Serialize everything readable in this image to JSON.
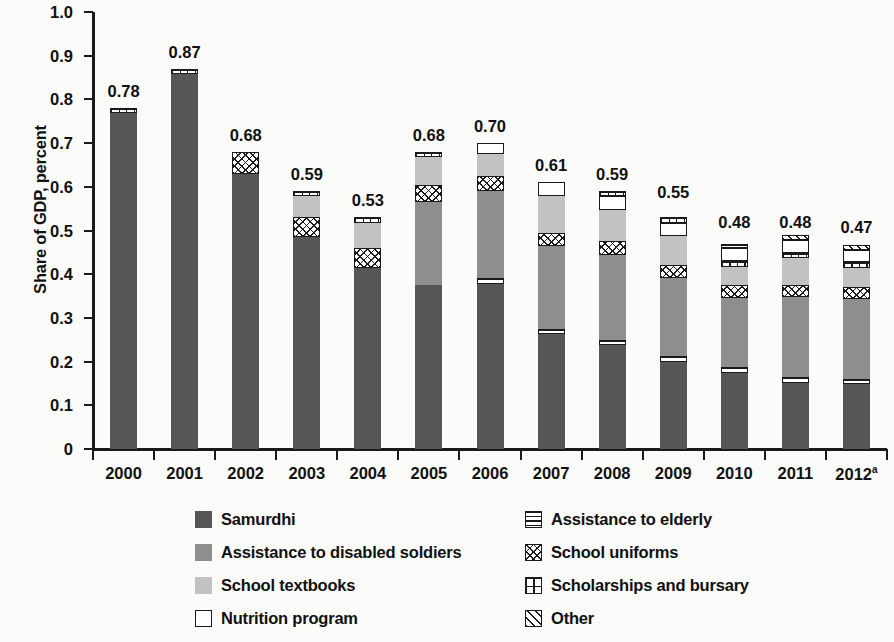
{
  "chart": {
    "type": "bar",
    "title": "",
    "ylabel": "Share of GDP, percent",
    "xlabel": ""
  },
  "axis": {
    "y_ticks": [
      "1.0",
      "0.9",
      "0.8",
      "0.7",
      "0.6",
      "0.5",
      "0.4",
      "0.3",
      "0.2",
      "0.1",
      "0"
    ],
    "y_values": [
      1.0,
      0.9,
      0.8,
      0.7,
      0.6,
      0.5,
      0.4,
      0.3,
      0.2,
      0.1,
      0
    ],
    "x_labels": [
      "2000",
      "2001",
      "2002",
      "2003",
      "2004",
      "2005",
      "2006",
      "2007",
      "2008",
      "2009",
      "2010",
      "2011"
    ],
    "x_label_last": "2012",
    "x_label_last_sup": "a"
  },
  "legend": {
    "items": [
      {
        "label": "Samurdhi",
        "key": "samurdhi",
        "pattern": "solid-dark-gray",
        "color": "#565656"
      },
      {
        "label": "Assistance to elderly",
        "key": "elderly",
        "pattern": "horizontal-lines",
        "color": "#ffffff"
      },
      {
        "label": "Assistance to disabled soldiers",
        "key": "soldiers",
        "pattern": "solid-medium-gray",
        "color": "#8e8e8e"
      },
      {
        "label": "School uniforms",
        "key": "uniforms",
        "pattern": "crosshatch",
        "color": "#ffffff"
      },
      {
        "label": "School textbooks",
        "key": "textbooks",
        "pattern": "solid-light-gray",
        "color": "#c2c2c2"
      },
      {
        "label": "Scholarships and bursary",
        "key": "scholar",
        "pattern": "grid",
        "color": "#ffffff"
      },
      {
        "label": "Nutrition program",
        "key": "nutrition",
        "pattern": "open-white",
        "color": "#ffffff"
      },
      {
        "label": "Other",
        "key": "other",
        "pattern": "diagonal-hatch",
        "color": "#ffffff"
      }
    ]
  },
  "chart_data": {
    "type": "bar",
    "subtype": "stacked",
    "title": "",
    "xlabel": "",
    "ylabel": "Share of GDP, percent",
    "ylim": [
      0,
      1.0
    ],
    "ytick_step": 0.1,
    "grid": false,
    "legend_position": "bottom",
    "categories": [
      "2000",
      "2001",
      "2002",
      "2003",
      "2004",
      "2005",
      "2006",
      "2007",
      "2008",
      "2009",
      "2010",
      "2011",
      "2012"
    ],
    "category_notes": {
      "2012": "a"
    },
    "stack_order_bottom_to_top": [
      "samurdhi",
      "elderly",
      "soldiers",
      "textbooks",
      "uniforms",
      "textbooks2",
      "scholar",
      "nutrition",
      "other"
    ],
    "series": [
      {
        "name": "Samurdhi",
        "key": "samurdhi",
        "values": [
          0.77,
          0.86,
          0.63,
          0.485,
          0.415,
          0.375,
          0.38,
          0.263,
          0.238,
          0.2,
          0.173,
          0.15,
          0.148
        ]
      },
      {
        "name": "Assistance to elderly",
        "key": "elderly",
        "values": [
          0.0,
          0.0,
          0.0,
          0.0,
          0.0,
          0.0,
          0.013,
          0.012,
          0.012,
          0.013,
          0.014,
          0.015,
          0.013
        ]
      },
      {
        "name": "Assistance to disabled soldiers",
        "key": "soldiers",
        "values": [
          0.0,
          0.0,
          0.0,
          0.0,
          0.0,
          0.175,
          0.195,
          0.175,
          0.175,
          0.175,
          0.155,
          0.18,
          0.18
        ]
      },
      {
        "name": "School uniforms",
        "key": "uniforms",
        "values": [
          0.0,
          0.0,
          0.05,
          0.045,
          0.045,
          0.04,
          0.035,
          0.03,
          0.03,
          0.03,
          0.03,
          0.028,
          0.027
        ]
      },
      {
        "name": "School textbooks",
        "key": "textbooks",
        "values": [
          0.0,
          0.0,
          0.0,
          0.05,
          0.045,
          0.055,
          0.045,
          0.085,
          0.09,
          0.09,
          0.042,
          0.06,
          0.045
        ]
      },
      {
        "name": "Scholarships and bursary",
        "key": "scholar",
        "values": [
          0.01,
          0.012,
          0.0,
          0.01,
          0.012,
          0.012,
          0.0,
          0.0,
          0.012,
          0.013,
          0.013,
          0.012,
          0.013
        ]
      },
      {
        "name": "Nutrition program",
        "key": "nutrition",
        "values": [
          0.0,
          0.0,
          0.0,
          0.0,
          0.0,
          0.0,
          0.025,
          0.03,
          0.03,
          0.03,
          0.03,
          0.03,
          0.027
        ]
      },
      {
        "name": "Other",
        "key": "other",
        "values": [
          0.0,
          0.0,
          0.0,
          0.0,
          0.0,
          0.0,
          0.0,
          0.0,
          0.0,
          0.0,
          0.0,
          0.012,
          0.013
        ]
      }
    ],
    "totals": [
      0.78,
      0.87,
      0.68,
      0.59,
      0.53,
      0.68,
      0.7,
      0.61,
      0.59,
      0.55,
      0.48,
      0.48,
      0.47
    ],
    "total_labels": [
      "0.78",
      "0.87",
      "0.68",
      "0.59",
      "0.53",
      "0.68",
      "0.70",
      "0.61",
      "0.59",
      "0.55",
      "0.48",
      "0.48",
      "0.47"
    ],
    "bars": [
      {
        "category": "2000",
        "total": 0.78,
        "label": "0.78",
        "segments": [
          {
            "key": "samurdhi",
            "value": 0.77
          },
          {
            "key": "scholar",
            "value": 0.01
          }
        ]
      },
      {
        "category": "2001",
        "total": 0.87,
        "label": "0.87",
        "segments": [
          {
            "key": "samurdhi",
            "value": 0.858
          },
          {
            "key": "scholar",
            "value": 0.012
          }
        ]
      },
      {
        "category": "2002",
        "total": 0.68,
        "label": "0.68",
        "segments": [
          {
            "key": "samurdhi",
            "value": 0.63
          },
          {
            "key": "uniforms",
            "value": 0.05
          }
        ]
      },
      {
        "category": "2003",
        "total": 0.59,
        "label": "0.59",
        "segments": [
          {
            "key": "samurdhi",
            "value": 0.485
          },
          {
            "key": "uniforms",
            "value": 0.045
          },
          {
            "key": "textbooks",
            "value": 0.05
          },
          {
            "key": "scholar",
            "value": 0.01
          }
        ]
      },
      {
        "category": "2004",
        "total": 0.53,
        "label": "0.53",
        "segments": [
          {
            "key": "samurdhi",
            "value": 0.415
          },
          {
            "key": "uniforms",
            "value": 0.045
          },
          {
            "key": "textbooks",
            "value": 0.058
          },
          {
            "key": "scholar",
            "value": 0.012
          }
        ]
      },
      {
        "category": "2005",
        "total": 0.68,
        "label": "0.68",
        "segments": [
          {
            "key": "samurdhi",
            "value": 0.375
          },
          {
            "key": "soldiers",
            "value": 0.19
          },
          {
            "key": "uniforms",
            "value": 0.04
          },
          {
            "key": "textbooks",
            "value": 0.063
          },
          {
            "key": "scholar",
            "value": 0.012
          }
        ]
      },
      {
        "category": "2006",
        "total": 0.7,
        "label": "0.70",
        "segments": [
          {
            "key": "samurdhi",
            "value": 0.378
          },
          {
            "key": "elderly",
            "value": 0.013
          },
          {
            "key": "soldiers",
            "value": 0.199
          },
          {
            "key": "uniforms",
            "value": 0.035
          },
          {
            "key": "textbooks",
            "value": 0.05
          },
          {
            "key": "nutrition",
            "value": 0.025
          }
        ]
      },
      {
        "category": "2007",
        "total": 0.61,
        "label": "0.61",
        "segments": [
          {
            "key": "samurdhi",
            "value": 0.263
          },
          {
            "key": "elderly",
            "value": 0.012
          },
          {
            "key": "soldiers",
            "value": 0.19
          },
          {
            "key": "uniforms",
            "value": 0.03
          },
          {
            "key": "textbooks",
            "value": 0.085
          },
          {
            "key": "nutrition",
            "value": 0.03
          }
        ]
      },
      {
        "category": "2008",
        "total": 0.59,
        "label": "0.59",
        "segments": [
          {
            "key": "samurdhi",
            "value": 0.238
          },
          {
            "key": "elderly",
            "value": 0.012
          },
          {
            "key": "soldiers",
            "value": 0.195
          },
          {
            "key": "uniforms",
            "value": 0.03
          },
          {
            "key": "textbooks",
            "value": 0.073
          },
          {
            "key": "nutrition",
            "value": 0.03
          },
          {
            "key": "scholar",
            "value": 0.012
          }
        ]
      },
      {
        "category": "2009",
        "total": 0.55,
        "label": "0.55",
        "segments": [
          {
            "key": "samurdhi",
            "value": 0.2
          },
          {
            "key": "elderly",
            "value": 0.013
          },
          {
            "key": "soldiers",
            "value": 0.178
          },
          {
            "key": "uniforms",
            "value": 0.03
          },
          {
            "key": "textbooks",
            "value": 0.066
          },
          {
            "key": "nutrition",
            "value": 0.03
          },
          {
            "key": "scholar",
            "value": 0.013
          }
        ]
      },
      {
        "category": "2010",
        "total": 0.48,
        "label": "0.48",
        "segments": [
          {
            "key": "samurdhi",
            "value": 0.173
          },
          {
            "key": "elderly",
            "value": 0.014
          },
          {
            "key": "soldiers",
            "value": 0.158
          },
          {
            "key": "uniforms",
            "value": 0.03
          },
          {
            "key": "textbooks",
            "value": 0.042
          },
          {
            "key": "scholar",
            "value": 0.013
          },
          {
            "key": "nutrition",
            "value": 0.03
          },
          {
            "key": "elderly",
            "value": 0.01
          }
        ]
      },
      {
        "category": "2011",
        "total": 0.48,
        "label": "0.48",
        "segments": [
          {
            "key": "samurdhi",
            "value": 0.15
          },
          {
            "key": "elderly",
            "value": 0.015
          },
          {
            "key": "soldiers",
            "value": 0.183
          },
          {
            "key": "uniforms",
            "value": 0.028
          },
          {
            "key": "textbooks",
            "value": 0.06
          },
          {
            "key": "scholar",
            "value": 0.012
          },
          {
            "key": "nutrition",
            "value": 0.03
          },
          {
            "key": "other",
            "value": 0.012
          }
        ]
      },
      {
        "category": "2012",
        "total": 0.47,
        "label": "0.47",
        "segments": [
          {
            "key": "samurdhi",
            "value": 0.148
          },
          {
            "key": "elderly",
            "value": 0.013
          },
          {
            "key": "soldiers",
            "value": 0.182
          },
          {
            "key": "uniforms",
            "value": 0.027
          },
          {
            "key": "textbooks",
            "value": 0.045
          },
          {
            "key": "scholar",
            "value": 0.013
          },
          {
            "key": "nutrition",
            "value": 0.027
          },
          {
            "key": "other",
            "value": 0.013
          }
        ]
      }
    ]
  }
}
